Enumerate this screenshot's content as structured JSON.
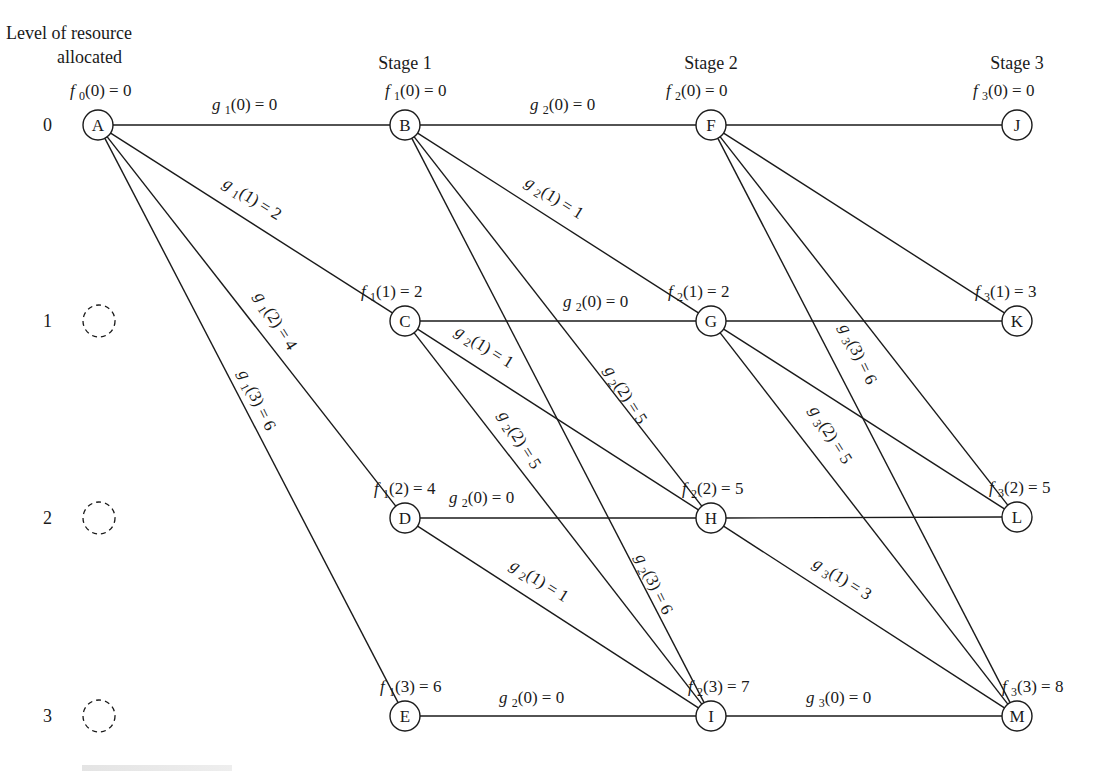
{
  "header": {
    "level_title_line1": "Level of resource",
    "level_title_line2": "allocated",
    "stages": [
      {
        "label": "Stage 1",
        "x": 405
      },
      {
        "label": "Stage 2",
        "x": 711
      },
      {
        "label": "Stage 3",
        "x": 1017
      }
    ]
  },
  "levels": [
    {
      "label": "0",
      "y": 125
    },
    {
      "label": "1",
      "y": 321
    },
    {
      "label": "2",
      "y": 518
    },
    {
      "label": "3",
      "y": 716
    }
  ],
  "ghost_nodes": [
    {
      "x": 99,
      "y": 321
    },
    {
      "x": 99,
      "y": 518
    },
    {
      "x": 99,
      "y": 716
    }
  ],
  "nodes": [
    {
      "id": "A",
      "x": 98,
      "y": 125,
      "f": {
        "sym": "f",
        "sub": "0",
        "arg": "(0) = 0",
        "x": 70,
        "y": 96
      }
    },
    {
      "id": "B",
      "x": 405,
      "y": 125,
      "f": {
        "sym": "f",
        "sub": "1",
        "arg": "(0) = 0",
        "x": 385,
        "y": 96
      }
    },
    {
      "id": "C",
      "x": 405,
      "y": 321,
      "f": {
        "sym": "f",
        "sub": "1",
        "arg": "(1) = 2",
        "x": 361,
        "y": 297
      }
    },
    {
      "id": "D",
      "x": 405,
      "y": 518,
      "f": {
        "sym": "f",
        "sub": "1",
        "arg": "(2) = 4",
        "x": 374,
        "y": 494
      }
    },
    {
      "id": "E",
      "x": 405,
      "y": 716,
      "f": {
        "sym": "f",
        "sub": "1",
        "arg": "(3) = 6",
        "x": 380,
        "y": 692
      }
    },
    {
      "id": "F",
      "x": 711,
      "y": 125,
      "f": {
        "sym": "f",
        "sub": "2",
        "arg": "(0) = 0",
        "x": 666,
        "y": 96
      }
    },
    {
      "id": "G",
      "x": 711,
      "y": 321,
      "f": {
        "sym": "f",
        "sub": "2",
        "arg": "(1) = 2",
        "x": 668,
        "y": 297
      }
    },
    {
      "id": "H",
      "x": 711,
      "y": 518,
      "f": {
        "sym": "f",
        "sub": "2",
        "arg": "(2) = 5",
        "x": 682,
        "y": 494
      }
    },
    {
      "id": "I",
      "x": 711,
      "y": 716,
      "f": {
        "sym": "f",
        "sub": "2",
        "arg": "(3) = 7",
        "x": 688,
        "y": 692
      }
    },
    {
      "id": "J",
      "x": 1017,
      "y": 125,
      "f": {
        "sym": "f",
        "sub": "3",
        "arg": "(0) = 0",
        "x": 973,
        "y": 96
      }
    },
    {
      "id": "K",
      "x": 1017,
      "y": 321,
      "f": {
        "sym": "f",
        "sub": "3",
        "arg": "(1) = 3",
        "x": 975,
        "y": 297
      }
    },
    {
      "id": "L",
      "x": 1017,
      "y": 517,
      "f": {
        "sym": "f",
        "sub": "3",
        "arg": "(2) = 5",
        "x": 989,
        "y": 493
      }
    },
    {
      "id": "M",
      "x": 1017,
      "y": 716,
      "f": {
        "sym": "f",
        "sub": "3",
        "arg": "(3) = 8",
        "x": 1002,
        "y": 692
      }
    }
  ],
  "edges": [
    {
      "from": "A",
      "to": "B",
      "label": {
        "sub": "1",
        "arg": "(0) = 0",
        "x": 212,
        "y": 110,
        "rot": 0
      }
    },
    {
      "from": "A",
      "to": "C",
      "label": {
        "sub": "1",
        "arg": "(1) = 2",
        "x": 222,
        "y": 186,
        "rot": 32
      }
    },
    {
      "from": "A",
      "to": "D",
      "label": {
        "sub": "1",
        "arg": "(2) = 4",
        "x": 254,
        "y": 296,
        "rot": 58
      }
    },
    {
      "from": "A",
      "to": "E",
      "label": {
        "sub": "1",
        "arg": "(3) = 6",
        "x": 238,
        "y": 373,
        "rot": 64
      }
    },
    {
      "from": "B",
      "to": "F",
      "label": {
        "sub": "2",
        "arg": "(0) = 0",
        "x": 530,
        "y": 110,
        "rot": 0
      }
    },
    {
      "from": "B",
      "to": "G",
      "label": {
        "sub": "2",
        "arg": "(1) = 1",
        "x": 524,
        "y": 185,
        "rot": 32
      }
    },
    {
      "from": "B",
      "to": "H",
      "label": {
        "sub": "2",
        "arg": "(2) = 5",
        "x": 604,
        "y": 370,
        "rot": 58
      }
    },
    {
      "from": "B",
      "to": "I",
      "label": {
        "sub": "2",
        "arg": "(3) = 6",
        "x": 635,
        "y": 557,
        "rot": 64
      }
    },
    {
      "from": "C",
      "to": "G",
      "label": {
        "sub": "2",
        "arg": "(0) = 0",
        "x": 563,
        "y": 307,
        "rot": 0
      }
    },
    {
      "from": "C",
      "to": "H",
      "label": {
        "sub": "2",
        "arg": "(1) = 1",
        "x": 454,
        "y": 334,
        "rot": 32
      }
    },
    {
      "from": "C",
      "to": "I",
      "label": {
        "sub": "2",
        "arg": "(2) = 5",
        "x": 498,
        "y": 415,
        "rot": 58
      }
    },
    {
      "from": "D",
      "to": "H",
      "label": {
        "sub": "2",
        "arg": "(0) = 0",
        "x": 449,
        "y": 503,
        "rot": 0
      }
    },
    {
      "from": "D",
      "to": "I",
      "label": {
        "sub": "2",
        "arg": "(1) = 1",
        "x": 509,
        "y": 568,
        "rot": 32
      }
    },
    {
      "from": "E",
      "to": "I",
      "label": {
        "sub": "2",
        "arg": "(0) = 0",
        "x": 499,
        "y": 703,
        "rot": 0
      }
    },
    {
      "from": "F",
      "to": "J",
      "label": null
    },
    {
      "from": "F",
      "to": "K",
      "label": null
    },
    {
      "from": "F",
      "to": "L",
      "label": null
    },
    {
      "from": "F",
      "to": "M",
      "label": {
        "sub": "3",
        "arg": "(3) = 6",
        "x": 839,
        "y": 327,
        "rot": 64
      }
    },
    {
      "from": "G",
      "to": "K",
      "label": null
    },
    {
      "from": "G",
      "to": "L",
      "label": null
    },
    {
      "from": "G",
      "to": "M",
      "label": {
        "sub": "3",
        "arg": "(2) = 5",
        "x": 809,
        "y": 410,
        "rot": 58
      }
    },
    {
      "from": "H",
      "to": "L",
      "label": null
    },
    {
      "from": "H",
      "to": "M",
      "label": {
        "sub": "3",
        "arg": "(1) = 3",
        "x": 812,
        "y": 566,
        "rot": 32
      }
    },
    {
      "from": "I",
      "to": "M",
      "label": {
        "sub": "3",
        "arg": "(0) = 0",
        "x": 806,
        "y": 703,
        "rot": 0
      }
    }
  ],
  "edge_symbol": "g",
  "node_radius": 15,
  "ghost_radius": 16,
  "colors": {
    "ink": "#1a1a1a",
    "background": "#ffffff"
  }
}
